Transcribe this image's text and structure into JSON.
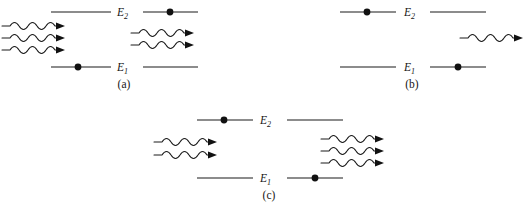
{
  "figure": {
    "background_color": "#ffffff",
    "line_color": "#1a1a1a",
    "electron_color": "#111111",
    "width": 529,
    "height": 212
  },
  "labels": {
    "upper_level": "E",
    "upper_level_subscript": "2",
    "lower_level": "E",
    "lower_level_subscript": "1"
  },
  "panels": [
    {
      "id": "a",
      "caption": "(a)",
      "process": "absorption",
      "upper_level_label": "E",
      "upper_level_sub": "2",
      "lower_level_label": "E",
      "lower_level_sub": "1",
      "electron_before_level": "E1",
      "electron_after_level": "E2",
      "photons_in": 3,
      "photons_out": 2,
      "incoming_photon_count": "3",
      "outgoing_photon_count": "2"
    },
    {
      "id": "b",
      "caption": "(b)",
      "process": "spontaneous-emission",
      "upper_level_label": "E",
      "upper_level_sub": "2",
      "lower_level_label": "E",
      "lower_level_sub": "1",
      "electron_before_level": "E2",
      "electron_after_level": "E1",
      "photons_in": 0,
      "photons_out": 1,
      "incoming_photon_count": "0",
      "outgoing_photon_count": "1"
    },
    {
      "id": "c",
      "caption": "(c)",
      "process": "stimulated-emission",
      "upper_level_label": "E",
      "upper_level_sub": "2",
      "lower_level_label": "E",
      "lower_level_sub": "1",
      "electron_before_level": "E2",
      "electron_after_level": "E1",
      "photons_in": 2,
      "photons_out": 3,
      "incoming_photon_count": "2",
      "outgoing_photon_count": "3"
    }
  ]
}
